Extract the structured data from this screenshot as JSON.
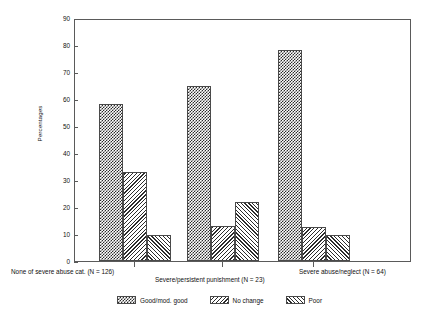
{
  "chart_data": {
    "type": "bar",
    "title": "",
    "xlabel": "",
    "ylabel": "Percentages",
    "ylim": [
      0,
      90
    ],
    "ytick_labels": [
      "0",
      "10",
      "20",
      "30",
      "40",
      "50",
      "60",
      "70",
      "80",
      "90"
    ],
    "ytick_values": [
      0,
      10,
      20,
      30,
      40,
      50,
      60,
      70,
      80,
      90
    ],
    "grid": false,
    "legend_position": "bottom-center",
    "categories": [
      "None of severe abuse cat. (N = 126)",
      "Severe/persistent punishment (N = 23)",
      "Severe abuse/neglect (N = 64)"
    ],
    "series": [
      {
        "name": "Good/mod. good",
        "pattern": "checkerboard",
        "values": [
          58,
          65,
          78
        ]
      },
      {
        "name": "No change",
        "pattern": "backslash-hatch",
        "values": [
          33,
          13,
          12.5
        ]
      },
      {
        "name": "Poor",
        "pattern": "forwardslash-hatch",
        "values": [
          9.5,
          22,
          9.5
        ]
      }
    ]
  },
  "axis": {
    "y_title": "Percentages"
  },
  "legend": {
    "entries": [
      {
        "label": "Good/mod. good",
        "pattern": "checkerboard"
      },
      {
        "label": "No change",
        "pattern": "backslash-hatch"
      },
      {
        "label": "Poor",
        "pattern": "forwardslash-hatch"
      }
    ]
  },
  "colors": {
    "ink": "#2b2b2b",
    "frame": "#5a5a5a",
    "background": "#ffffff"
  }
}
